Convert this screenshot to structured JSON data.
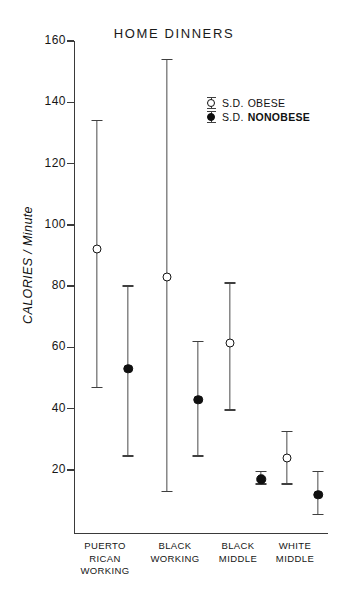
{
  "chart_data": {
    "type": "scatter",
    "title": "HOME DINNERS",
    "subtitle": "",
    "xlabel": "",
    "ylabel": "CALORIES / Minute",
    "categories": [
      "PUERTO RICAN WORKING",
      "BLACK WORKING",
      "BLACK MIDDLE",
      "WHITE MIDDLE"
    ],
    "category_lines": [
      [
        "PUERTO",
        "RICAN",
        "WORKING"
      ],
      [
        "BLACK",
        "WORKING"
      ],
      [
        "BLACK",
        "MIDDLE"
      ],
      [
        "WHITE",
        "MIDDLE"
      ]
    ],
    "ylim": [
      0,
      160
    ],
    "yticks": [
      20,
      40,
      60,
      80,
      100,
      120,
      140,
      160
    ],
    "ytick_labels": [
      "20",
      "40",
      "60",
      "80",
      "100",
      "120",
      "140",
      "160"
    ],
    "grid": false,
    "legend_position": "upper-right",
    "series": [
      {
        "name": "S.D. OBESE",
        "marker": "open-circle",
        "color": "#111111",
        "values": [
          92,
          83,
          61.5,
          24
        ],
        "sd_low": [
          47,
          13,
          39.5,
          15.5
        ],
        "sd_high": [
          134,
          154,
          81,
          32.5
        ]
      },
      {
        "name": "S.D. NONOBESE",
        "marker": "filled-circle",
        "color": "#101010",
        "values": [
          53,
          43,
          17,
          12
        ],
        "sd_low": [
          24.5,
          24.5,
          15.5,
          5.5
        ],
        "sd_high": [
          80,
          62,
          19.5,
          19.5
        ]
      }
    ]
  },
  "legend": {
    "rows": [
      {
        "sd": "S.D.",
        "name": "OBESE",
        "marker": "open-circle"
      },
      {
        "sd": "S.D.",
        "name": "NONOBESE",
        "marker": "filled-circle"
      }
    ]
  }
}
